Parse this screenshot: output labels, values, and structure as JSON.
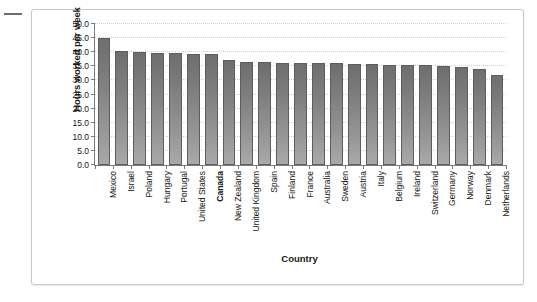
{
  "chart_data": {
    "type": "bar",
    "title": "",
    "xlabel": "Country",
    "ylabel": "Hours worked per week",
    "ylim": [
      0.0,
      50.0
    ],
    "ytick_step": 5.0,
    "grid": true,
    "legend": null,
    "yticks": [
      "0.0",
      "5.0",
      "10.0",
      "15.0",
      "20.0",
      "25.0",
      "30.0",
      "35.0",
      "40.0",
      "45.0",
      "50.0"
    ],
    "categories": [
      "Mexico",
      "Israel",
      "Poland",
      "Hungary",
      "Portugal",
      "United States",
      "Canada",
      "New Zealand",
      "United Kingdom",
      "Spain",
      "Finland",
      "France",
      "Australia",
      "Sweden",
      "Austria",
      "Italy",
      "Belgium",
      "Ireland",
      "Switzerland",
      "Germany",
      "Norway",
      "Denmark",
      "Netherlands"
    ],
    "values": [
      45.2,
      40.6,
      39.9,
      39.6,
      39.7,
      39.5,
      39.3,
      37.2,
      36.5,
      36.4,
      36.3,
      36.2,
      36.1,
      36.0,
      35.9,
      35.8,
      35.6,
      35.5,
      35.3,
      35.0,
      34.7,
      33.9,
      31.8
    ],
    "highlighted_category": "Canada",
    "bar_color": "#8a8a8a"
  },
  "axes": {
    "y_title": "Hours worked per week",
    "x_title": "Country"
  }
}
